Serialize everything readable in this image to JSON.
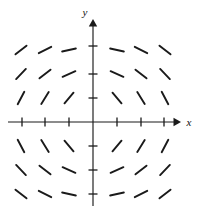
{
  "figure": {
    "title": "",
    "type": "slope-field",
    "width": 205,
    "height": 213,
    "background_color": "#ffffff",
    "stroke_color": "#1a1a1a"
  },
  "axes": {
    "x_axis": {
      "label": "x",
      "label_position": "right-end",
      "arrow": "right",
      "y_pixel": 122,
      "x_start_pixel": 8,
      "x_end_pixel": 178,
      "tick_count": 6,
      "tick_pixels": [
        22,
        45,
        69,
        117,
        141,
        164
      ],
      "tick_labels": [
        "",
        "",
        "",
        "",
        "",
        ""
      ],
      "tick_length": 9
    },
    "y_axis": {
      "label": "y",
      "label_position": "top-end",
      "arrow": "up",
      "x_pixel": 93,
      "y_start_pixel": 206,
      "y_end_pixel": 22,
      "tick_count": 6,
      "tick_pixels": [
        46,
        74,
        98,
        146,
        170,
        194
      ],
      "tick_labels": [
        "",
        "",
        "",
        "",
        "",
        ""
      ],
      "tick_length": 9
    },
    "origin_pixel": [
      93,
      122
    ],
    "grid": false
  },
  "chart_data": {
    "type": "scatter",
    "subtype": "slope-field",
    "title": "",
    "xlabel": "x",
    "ylabel": "y",
    "xlim": [
      -3.5,
      3.5
    ],
    "ylim": [
      -3.5,
      3.5
    ],
    "grid": false,
    "legend": null,
    "x": [
      -3,
      -2,
      -1,
      1,
      2,
      3
    ],
    "y": [
      3,
      2,
      1,
      -1,
      -2,
      -3
    ],
    "segment_length": 14,
    "segments": [
      {
        "x": -3,
        "y": 3,
        "angle_deg": 38
      },
      {
        "x": -2,
        "y": 3,
        "angle_deg": 27
      },
      {
        "x": -1,
        "y": 3,
        "angle_deg": 12
      },
      {
        "x": 1,
        "y": 3,
        "angle_deg": -12
      },
      {
        "x": 2,
        "y": 3,
        "angle_deg": -27
      },
      {
        "x": 3,
        "y": 3,
        "angle_deg": -38
      },
      {
        "x": -3,
        "y": 2,
        "angle_deg": 46
      },
      {
        "x": -2,
        "y": 2,
        "angle_deg": 38
      },
      {
        "x": -1,
        "y": 2,
        "angle_deg": 24
      },
      {
        "x": 1,
        "y": 2,
        "angle_deg": -24
      },
      {
        "x": 2,
        "y": 2,
        "angle_deg": -38
      },
      {
        "x": 3,
        "y": 2,
        "angle_deg": -46
      },
      {
        "x": -3,
        "y": 1,
        "angle_deg": 62
      },
      {
        "x": -2,
        "y": 1,
        "angle_deg": 58
      },
      {
        "x": -1,
        "y": 1,
        "angle_deg": 50
      },
      {
        "x": 1,
        "y": 1,
        "angle_deg": -50
      },
      {
        "x": 2,
        "y": 1,
        "angle_deg": -58
      },
      {
        "x": 3,
        "y": 1,
        "angle_deg": -62
      },
      {
        "x": -3,
        "y": -1,
        "angle_deg": -62
      },
      {
        "x": -2,
        "y": -1,
        "angle_deg": -58
      },
      {
        "x": -1,
        "y": -1,
        "angle_deg": -50
      },
      {
        "x": 1,
        "y": -1,
        "angle_deg": 50
      },
      {
        "x": 2,
        "y": -1,
        "angle_deg": 58
      },
      {
        "x": 3,
        "y": -1,
        "angle_deg": 62
      },
      {
        "x": -3,
        "y": -2,
        "angle_deg": -46
      },
      {
        "x": -2,
        "y": -2,
        "angle_deg": -38
      },
      {
        "x": -1,
        "y": -2,
        "angle_deg": -24
      },
      {
        "x": 1,
        "y": -2,
        "angle_deg": 24
      },
      {
        "x": 2,
        "y": -2,
        "angle_deg": 38
      },
      {
        "x": 3,
        "y": -2,
        "angle_deg": 46
      },
      {
        "x": -3,
        "y": -3,
        "angle_deg": -38
      },
      {
        "x": -2,
        "y": -3,
        "angle_deg": -27
      },
      {
        "x": -1,
        "y": -3,
        "angle_deg": -12
      },
      {
        "x": 1,
        "y": -3,
        "angle_deg": 12
      },
      {
        "x": 2,
        "y": -3,
        "angle_deg": 27
      },
      {
        "x": 3,
        "y": -3,
        "angle_deg": 38
      }
    ]
  }
}
